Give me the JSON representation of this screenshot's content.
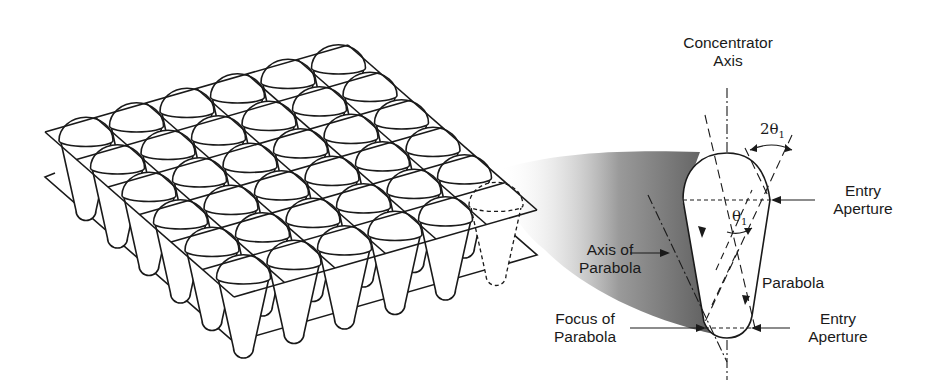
{
  "figure": {
    "array": {
      "rows": 6,
      "columns": 6,
      "highlighted_cell": "right corner (dashed outline)"
    },
    "labels": {
      "concentrator_axis": [
        "Concentrator",
        "Axis"
      ],
      "acceptance_angle": "2θ",
      "acceptance_angle_sub": "1",
      "half_angle": "θ",
      "half_angle_sub": "1",
      "entry_aperture_top": [
        "Entry",
        "Aperture"
      ],
      "axis_of_parabola": [
        "Axis of",
        "Parabola"
      ],
      "parabola": "Parabola",
      "focus_of_parabola": [
        "Focus of",
        "Parabola"
      ],
      "entry_aperture_bottom": [
        "Entry",
        "Aperture"
      ]
    },
    "colors": {
      "line": "#1a1a1a",
      "shade_dark": "#6e6e6e",
      "shade_light": "#ffffff",
      "background": "#ffffff"
    }
  }
}
